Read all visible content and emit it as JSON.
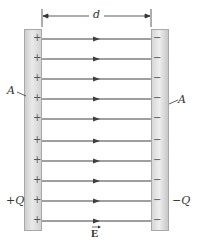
{
  "diagram": {
    "type": "parallel-plate-capacitor",
    "labels": {
      "separation": "d",
      "area_left": "A",
      "area_right": "A",
      "charge_left": "+Q",
      "charge_right": "−Q",
      "field": "E"
    },
    "plate_left": {
      "sign": "+",
      "count": 10
    },
    "plate_right": {
      "sign": "−",
      "count": 10
    },
    "field_lines": {
      "count": 10,
      "y_positions": [
        39,
        59,
        79,
        99,
        119,
        141,
        161,
        181,
        201,
        221
      ],
      "direction": "left-to-right",
      "color": "#404040"
    },
    "colors": {
      "plate_fill": "#e0e0e0",
      "plate_edge": "#a8a8a8",
      "line": "#404040",
      "text": "#333333"
    }
  }
}
